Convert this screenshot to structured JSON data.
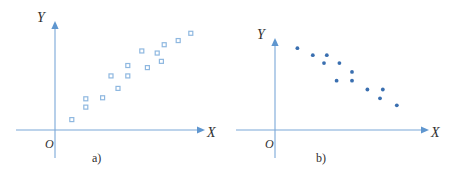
{
  "figure": {
    "background_color": "#ffffff",
    "axis_color": "#7aa8d8",
    "label_color": "#2f2f2f"
  },
  "panels": [
    {
      "id": "a",
      "caption": "a)",
      "x_axis_label": "X",
      "y_axis_label": "Y",
      "origin_label": "O"
    },
    {
      "id": "b",
      "caption": "b)",
      "x_axis_label": "X",
      "y_axis_label": "Y",
      "origin_label": "O"
    }
  ],
  "chart_data": [
    {
      "type": "scatter",
      "title": "a)",
      "xlabel": "X",
      "ylabel": "Y",
      "origin_label": "O",
      "marker": "open-square",
      "marker_color": "#8fb8e0",
      "marker_size": 4,
      "correlation": "positive",
      "grid": false,
      "legend": null,
      "xlim": [
        0,
        100
      ],
      "ylim": [
        0,
        100
      ],
      "points": [
        {
          "x": 12,
          "y": 10
        },
        {
          "x": 22,
          "y": 22
        },
        {
          "x": 22,
          "y": 30
        },
        {
          "x": 34,
          "y": 31
        },
        {
          "x": 45,
          "y": 40
        },
        {
          "x": 40,
          "y": 52
        },
        {
          "x": 52,
          "y": 52
        },
        {
          "x": 52,
          "y": 62
        },
        {
          "x": 62,
          "y": 76
        },
        {
          "x": 73,
          "y": 74
        },
        {
          "x": 66,
          "y": 60
        },
        {
          "x": 76,
          "y": 66
        },
        {
          "x": 78,
          "y": 82
        },
        {
          "x": 88,
          "y": 86
        },
        {
          "x": 97,
          "y": 93
        }
      ]
    },
    {
      "type": "scatter",
      "title": "b)",
      "xlabel": "X",
      "ylabel": "Y",
      "origin_label": "O",
      "marker": "filled-circle",
      "marker_color": "#3a6fb0",
      "marker_size": 3,
      "correlation": "negative",
      "grid": false,
      "legend": null,
      "xlim": [
        0,
        100
      ],
      "ylim": [
        0,
        100
      ],
      "points": [
        {
          "x": 16,
          "y": 93
        },
        {
          "x": 27,
          "y": 85
        },
        {
          "x": 37,
          "y": 85
        },
        {
          "x": 35,
          "y": 76
        },
        {
          "x": 46,
          "y": 76
        },
        {
          "x": 55,
          "y": 66
        },
        {
          "x": 44,
          "y": 56
        },
        {
          "x": 55,
          "y": 56
        },
        {
          "x": 66,
          "y": 46
        },
        {
          "x": 77,
          "y": 46
        },
        {
          "x": 75,
          "y": 36
        },
        {
          "x": 87,
          "y": 28
        }
      ]
    }
  ]
}
